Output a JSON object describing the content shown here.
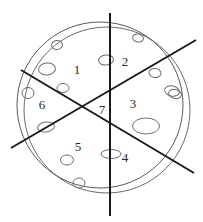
{
  "figure": {
    "kind": "sectored-circle-diagram",
    "width": 203,
    "height": 222,
    "background_color": "#ffffff",
    "outline_color": "#5a5a5a",
    "line_color": "#1a1a1a",
    "label_color": "#2b2b2b",
    "speckle_color": "#6e6e6e"
  },
  "circles": [
    {
      "name": "outer-rim-arc",
      "cx": 107,
      "cy": 110,
      "r": 83,
      "stroke": "#6b6b6b",
      "stroke_width": 1
    },
    {
      "name": "main-circle",
      "cx": 100,
      "cy": 105,
      "r": 83,
      "stroke": "#5a5a5a",
      "stroke_width": 1
    }
  ],
  "dividing_lines": [
    {
      "name": "vertical-line",
      "x1": 110,
      "y1": 13,
      "x2": 110,
      "y2": 216
    },
    {
      "name": "ascending-diagonal-line",
      "x1": 11,
      "y1": 148,
      "x2": 196,
      "y2": 40
    },
    {
      "name": "descending-diagonal-line",
      "x1": 21,
      "y1": 70,
      "x2": 194,
      "y2": 173
    }
  ],
  "sector_labels": [
    {
      "id": "sector-1",
      "text": "1",
      "x": 77,
      "y": 69
    },
    {
      "id": "sector-2",
      "text": "2",
      "x": 125,
      "y": 61
    },
    {
      "id": "sector-3",
      "text": "3",
      "x": 133,
      "y": 103
    },
    {
      "id": "sector-4",
      "text": "4",
      "x": 125,
      "y": 157
    },
    {
      "id": "sector-5",
      "text": "5",
      "x": 78,
      "y": 146
    },
    {
      "id": "sector-6",
      "text": "6",
      "x": 42,
      "y": 104
    },
    {
      "id": "sector-7",
      "text": "7",
      "x": 102,
      "y": 109
    }
  ],
  "speckles": [
    {
      "id": "speckle-01",
      "cx": 57,
      "cy": 45,
      "rx": 5.5,
      "ry": 4.5,
      "rot": -10
    },
    {
      "id": "speckle-02",
      "cx": 47,
      "cy": 69,
      "rx": 8.5,
      "ry": 6.0,
      "rot": -5
    },
    {
      "id": "speckle-03",
      "cx": 63,
      "cy": 88,
      "rx": 6.0,
      "ry": 4.5,
      "rot": 0
    },
    {
      "id": "speckle-04",
      "cx": 106,
      "cy": 60,
      "rx": 7.5,
      "ry": 5.0,
      "rot": -8
    },
    {
      "id": "speckle-05",
      "cx": 138,
      "cy": 38,
      "rx": 5.5,
      "ry": 4.0,
      "rot": 10
    },
    {
      "id": "speckle-06",
      "cx": 155,
      "cy": 73,
      "rx": 6.0,
      "ry": 4.5,
      "rot": 8
    },
    {
      "id": "speckle-07",
      "cx": 172,
      "cy": 91,
      "rx": 7.5,
      "ry": 5.0,
      "rot": 12
    },
    {
      "id": "speckle-08",
      "cx": 146,
      "cy": 126,
      "rx": 13.5,
      "ry": 8.0,
      "rot": 0
    },
    {
      "id": "speckle-09",
      "cx": 111,
      "cy": 154,
      "rx": 10.0,
      "ry": 4.5,
      "rot": 0
    },
    {
      "id": "speckle-10",
      "cx": 79,
      "cy": 183,
      "rx": 6.0,
      "ry": 5.0,
      "rot": 0
    },
    {
      "id": "speckle-11",
      "cx": 46,
      "cy": 127,
      "rx": 8.5,
      "ry": 5.0,
      "rot": -8
    },
    {
      "id": "speckle-12",
      "cx": 28,
      "cy": 93,
      "rx": 6.0,
      "ry": 5.5,
      "rot": 0
    },
    {
      "id": "speckle-13",
      "cx": 67,
      "cy": 160,
      "rx": 6.5,
      "ry": 5.0,
      "rot": 0
    },
    {
      "id": "speckle-14",
      "cx": 175,
      "cy": 94,
      "rx": 6.5,
      "ry": 4.5,
      "rot": 15
    }
  ]
}
